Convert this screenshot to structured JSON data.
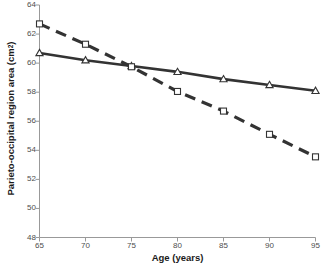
{
  "chart_data": {
    "type": "line",
    "title": "",
    "xlabel": "Age (years)",
    "ylabel": "Parieto-occipital region area (cm²)",
    "ylabel_main": "Parieto-occipital region area (cm",
    "ylabel_sup": "2",
    "ylabel_close": ")",
    "x": [
      65,
      70,
      75,
      80,
      85,
      90,
      95
    ],
    "xlim": [
      65,
      95
    ],
    "ylim": [
      48,
      64
    ],
    "xticks": [
      65,
      70,
      75,
      80,
      85,
      90,
      95
    ],
    "yticks": [
      48,
      50,
      52,
      54,
      56,
      58,
      60,
      62,
      64
    ],
    "grid": false,
    "legend": "none",
    "series": [
      {
        "name": "solid-triangle-series",
        "values": [
          60.7,
          60.2,
          59.8,
          59.4,
          58.9,
          58.5,
          58.1
        ],
        "linestyle": "solid",
        "marker": "triangle",
        "color": "#333333",
        "marker_fill": "#ffffff"
      },
      {
        "name": "dashed-square-series",
        "values": [
          62.7,
          61.3,
          59.75,
          58.05,
          56.7,
          55.1,
          53.55
        ],
        "linestyle": "dashed",
        "marker": "square",
        "color": "#333333",
        "marker_fill": "#ffffff"
      }
    ],
    "axis_color": "#999999",
    "tick_label_color": "#4d4d4d",
    "background": "#ffffff"
  }
}
